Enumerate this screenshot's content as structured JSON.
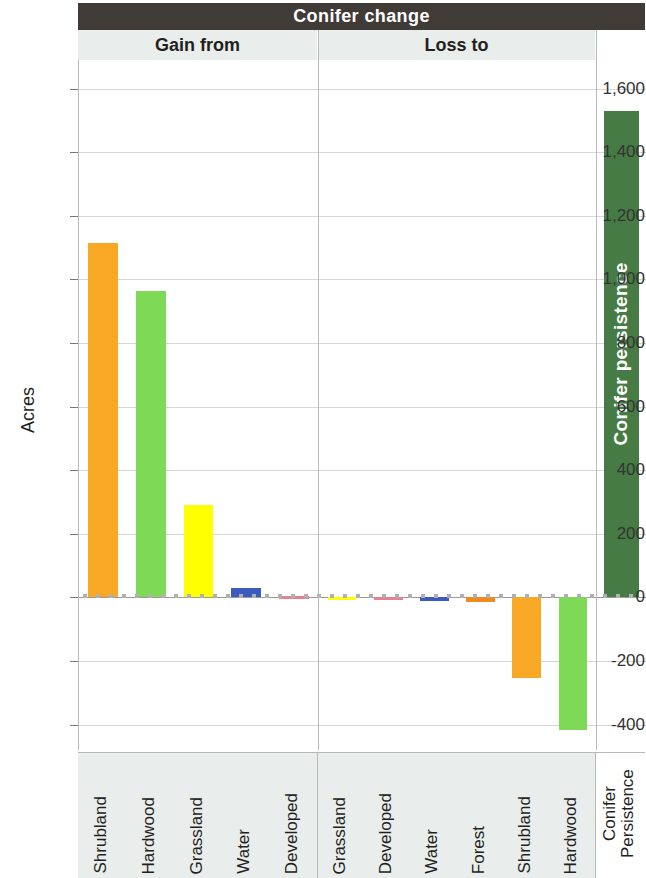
{
  "header": {
    "title": "Conifer change",
    "sections": [
      {
        "key": "gain",
        "label": "Gain from"
      },
      {
        "key": "loss",
        "label": "Loss to"
      },
      {
        "key": "persistence",
        "label": ""
      }
    ]
  },
  "colors": {
    "title_band": "#413b38",
    "sub_band": "#e9eeec",
    "shrubland": "#f9a825",
    "hardwood": "#7ed957",
    "grassland": "#ffff00",
    "water": "#3b5bbf",
    "developed": "#e8818f",
    "forest": "#f08a1e",
    "conifer_persistence": "#477b45",
    "gridline": "#d6d6d6",
    "zeroline": "#9a9a9a"
  },
  "chart_data": {
    "type": "bar",
    "title": "Conifer change",
    "xlabel": "",
    "ylabel": "Acres",
    "ylim": [
      -480,
      1690
    ],
    "yticks": [
      "-400",
      "-200",
      "0",
      "200",
      "400",
      "600",
      "800",
      "1,000",
      "1,200",
      "1,400",
      "1,600"
    ],
    "ytick_values": [
      -400,
      -200,
      0,
      200,
      400,
      600,
      800,
      1000,
      1200,
      1400,
      1600
    ],
    "grid": true,
    "legend": "none",
    "panels": [
      {
        "name": "Gain from",
        "categories": [
          "Shrubland",
          "Hardwood",
          "Grassland",
          "Water",
          "Developed"
        ],
        "values": [
          1113,
          963,
          290,
          28,
          3
        ],
        "colors": [
          "#f9a825",
          "#7ed957",
          "#ffff00",
          "#3b5bbf",
          "#e8818f"
        ]
      },
      {
        "name": "Loss to",
        "categories": [
          "Grassland",
          "Developed",
          "Water",
          "Forest",
          "Shrubland",
          "Hardwood"
        ],
        "values": [
          -2,
          -6,
          -10,
          -14,
          -253,
          -417
        ],
        "colors": [
          "#ffff00",
          "#e8818f",
          "#3b5bbf",
          "#f08a1e",
          "#f9a825",
          "#7ed957"
        ]
      },
      {
        "name": "",
        "categories": [
          "Conifer Persistence"
        ],
        "values": [
          1531
        ],
        "colors": [
          "#477b45"
        ]
      }
    ],
    "annotations": [
      {
        "text": "Conifer persistence",
        "target": "Conifer Persistence",
        "placement": "inside-bar",
        "color": "#ffffff"
      }
    ]
  },
  "axis": {
    "y_title": "Acres"
  },
  "bar_label": {
    "persistence": "Conifer persistence"
  },
  "categories_flat": [
    "Shrubland",
    "Hardwood",
    "Grassland",
    "Water",
    "Developed",
    "Grassland",
    "Developed",
    "Water",
    "Forest",
    "Shrubland",
    "Hardwood",
    "Conifer\nPersistence"
  ]
}
